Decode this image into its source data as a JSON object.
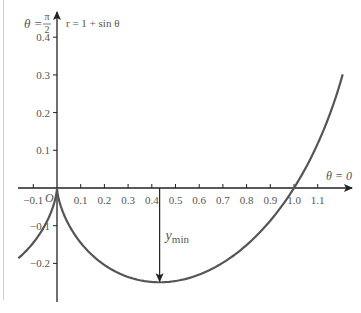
{
  "chart_data": {
    "type": "line",
    "title": "",
    "curve_label": "r = 1 + sin θ",
    "curve": {
      "equation": "r = 1 + sin θ",
      "x_param": "(1 + sin θ) cos θ",
      "y_param": "(1 + sin θ) sin θ",
      "theta_start": -2.29,
      "theta_end": 0.245
    },
    "y_axis_label": "θ = π/2",
    "x_axis_label": "θ = 0",
    "origin_label": "O",
    "xticks": [
      -0.1,
      0.1,
      0.2,
      0.3,
      0.4,
      0.5,
      0.6,
      0.7,
      0.8,
      0.9,
      1.0,
      1.1
    ],
    "yticks": [
      0.4,
      0.3,
      0.2,
      0.1,
      -0.1,
      -0.2
    ],
    "xtick_labels": [
      "−0.1",
      "0.1",
      "0.2",
      "0.3",
      "0.4",
      "0.5",
      "0.6",
      "0.7",
      "0.8",
      "0.9",
      "1.0",
      "1.1"
    ],
    "ytick_labels": [
      "0.4",
      "0.3",
      "0.2",
      "0.1",
      "−0.1",
      "−0.2"
    ],
    "xlim": [
      -0.15,
      1.2
    ],
    "ylim": [
      -0.3,
      0.5
    ],
    "annotation": {
      "label": "y",
      "subscript": "min",
      "x": 0.433,
      "y": -0.25
    },
    "grid": false,
    "colors": {
      "axis": "#222222",
      "curve": "#555555",
      "text": "#555555"
    }
  }
}
